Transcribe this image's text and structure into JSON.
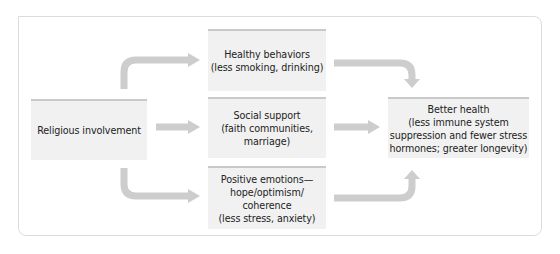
{
  "diagram": {
    "source": {
      "label": "Religious involvement"
    },
    "mediators": [
      {
        "label": "Healthy behaviors\n(less smoking, drinking)"
      },
      {
        "label": "Social support\n(faith communities,\nmarriage)"
      },
      {
        "label": "Positive emotions—\nhope/optimism/\ncoherence\n(less stress, anxiety)"
      }
    ],
    "outcome": {
      "label": "Better health\n(less immune system\nsuppression and fewer stress\nhormones; greater longevity)"
    },
    "colors": {
      "box_fill": "#f1f1f1",
      "box_top_border": "#c9c9c9",
      "arrow": "#cdcdcd",
      "frame_border": "#dcdcdc",
      "text": "#1e1e1e"
    }
  }
}
